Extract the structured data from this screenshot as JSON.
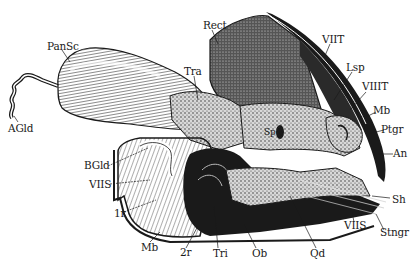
{
  "figure": {
    "ink_color": "#1a1a1a",
    "paper_color": "#ffffff"
  },
  "labels": {
    "AGld": {
      "text": "AGld",
      "x": 8,
      "y": 123
    },
    "PanSc": {
      "text": "PanSc",
      "x": 47,
      "y": 41
    },
    "Tra": {
      "text": "Tra",
      "x": 184,
      "y": 66
    },
    "Rect": {
      "text": "Rect",
      "x": 203,
      "y": 20
    },
    "VIIT": {
      "text": "VIIT",
      "x": 322,
      "y": 34
    },
    "Lsp": {
      "text": "Lsp",
      "x": 346,
      "y": 62
    },
    "VIIIT": {
      "text": "VIIIT",
      "x": 362,
      "y": 81
    },
    "Mb_top": {
      "text": "Mb",
      "x": 373,
      "y": 105
    },
    "Ptgr": {
      "text": "Ptgr",
      "x": 381,
      "y": 124
    },
    "An": {
      "text": "An",
      "x": 393,
      "y": 148
    },
    "Sp": {
      "text": "Sp",
      "x": 268,
      "y": 131
    },
    "BGld": {
      "text": "BGld",
      "x": 84,
      "y": 160
    },
    "VIIS_left": {
      "text": "VIIS",
      "x": 89,
      "y": 179
    },
    "1r": {
      "text": "1r",
      "x": 114,
      "y": 208
    },
    "Sh": {
      "text": "Sh",
      "x": 392,
      "y": 194
    },
    "VIIS_right": {
      "text": "VIIS",
      "x": 344,
      "y": 220
    },
    "Stngr": {
      "text": "Stngr",
      "x": 380,
      "y": 227
    },
    "Mb_bottom": {
      "text": "Mb",
      "x": 141,
      "y": 242
    },
    "2r": {
      "text": "2r",
      "x": 180,
      "y": 247
    },
    "Tri": {
      "text": "Tri",
      "x": 213,
      "y": 248
    },
    "Ob": {
      "text": "Ob",
      "x": 252,
      "y": 248
    },
    "Qd": {
      "text": "Qd",
      "x": 310,
      "y": 248
    }
  }
}
